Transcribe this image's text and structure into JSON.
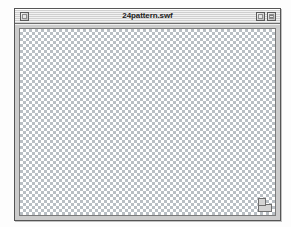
{
  "desktop": {
    "background_color": "#fdfdfd"
  },
  "window": {
    "title": "24pattern.swf",
    "frame_color": "#cccccc",
    "border_color": "#555555",
    "titlebar": {
      "style": "platinum-striped",
      "close_box_label": "Close",
      "zoom_box_label": "Zoom",
      "collapse_box_label": "Collapse"
    },
    "content": {
      "pattern_name": "transparency-checkerboard",
      "checker_light_color": "#ffffff",
      "checker_dark_color": "#b9bfc4",
      "checker_cell_px": 3
    },
    "resize_grip_label": "Resize"
  }
}
